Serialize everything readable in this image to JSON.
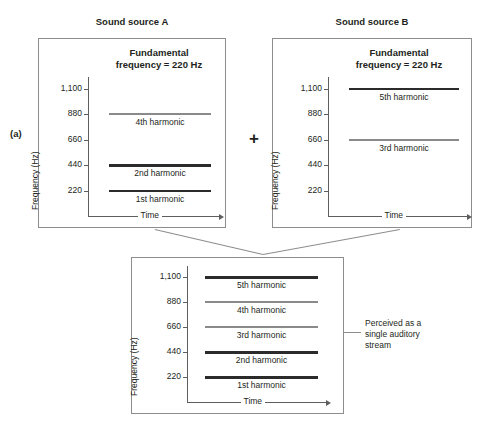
{
  "figure": {
    "part_label": "(a)",
    "operator": "+",
    "annotation": "Perceived as a\nsingle auditory\nstream"
  },
  "axis": {
    "y_label": "Frequency (Hz)",
    "x_label": "Time",
    "ticks": [
      "1,100",
      "880",
      "660",
      "440",
      "220"
    ],
    "tick_values": [
      1100,
      880,
      660,
      440,
      220
    ]
  },
  "panels": [
    {
      "id": "source-a",
      "title": "Sound source A",
      "heading": "Fundamental\nfrequency = 220 Hz",
      "harmonics": [
        {
          "label": "4th harmonic",
          "freq": 880,
          "color": "gray"
        },
        {
          "label": "2nd harmonic",
          "freq": 440,
          "color": "dark"
        },
        {
          "label": "1st harmonic",
          "freq": 220,
          "color": "dark"
        }
      ]
    },
    {
      "id": "source-b",
      "title": "Sound source B",
      "heading": "Fundamental\nfrequency = 220 Hz",
      "harmonics": [
        {
          "label": "5th harmonic",
          "freq": 1100,
          "color": "dark"
        },
        {
          "label": "3rd harmonic",
          "freq": 660,
          "color": "gray"
        }
      ]
    },
    {
      "id": "combined",
      "title": "",
      "heading": "",
      "harmonics": [
        {
          "label": "5th harmonic",
          "freq": 1100,
          "color": "dark"
        },
        {
          "label": "4th harmonic",
          "freq": 880,
          "color": "gray"
        },
        {
          "label": "3rd harmonic",
          "freq": 660,
          "color": "gray"
        },
        {
          "label": "2nd harmonic",
          "freq": 440,
          "color": "dark"
        },
        {
          "label": "1st harmonic",
          "freq": 220,
          "color": "dark"
        }
      ]
    }
  ],
  "chart_data": {
    "type": "line",
    "xlabel": "Time",
    "ylabel": "Frequency (Hz)",
    "ylim": [
      0,
      1200
    ],
    "yticks": [
      220,
      440,
      660,
      880,
      1100
    ],
    "grid": false,
    "legend": "none",
    "series": [
      {
        "name": "Sound source A - 1st harmonic",
        "panel": "source-a",
        "value": 220,
        "color": "#2b2b2b"
      },
      {
        "name": "Sound source A - 2nd harmonic",
        "panel": "source-a",
        "value": 440,
        "color": "#2b2b2b"
      },
      {
        "name": "Sound source A - 4th harmonic",
        "panel": "source-a",
        "value": 880,
        "color": "#8a8a8a"
      },
      {
        "name": "Sound source B - 3rd harmonic",
        "panel": "source-b",
        "value": 660,
        "color": "#8a8a8a"
      },
      {
        "name": "Sound source B - 5th harmonic",
        "panel": "source-b",
        "value": 1100,
        "color": "#2b2b2b"
      },
      {
        "name": "Combined - 1st harmonic",
        "panel": "combined",
        "value": 220,
        "color": "#2b2b2b"
      },
      {
        "name": "Combined - 2nd harmonic",
        "panel": "combined",
        "value": 440,
        "color": "#2b2b2b"
      },
      {
        "name": "Combined - 3rd harmonic",
        "panel": "combined",
        "value": 660,
        "color": "#8a8a8a"
      },
      {
        "name": "Combined - 4th harmonic",
        "panel": "combined",
        "value": 880,
        "color": "#8a8a8a"
      },
      {
        "name": "Combined - 5th harmonic",
        "panel": "combined",
        "value": 1100,
        "color": "#2b2b2b"
      }
    ],
    "annotations": [
      "Fundamental frequency = 220 Hz",
      "Perceived as a single auditory stream"
    ]
  }
}
